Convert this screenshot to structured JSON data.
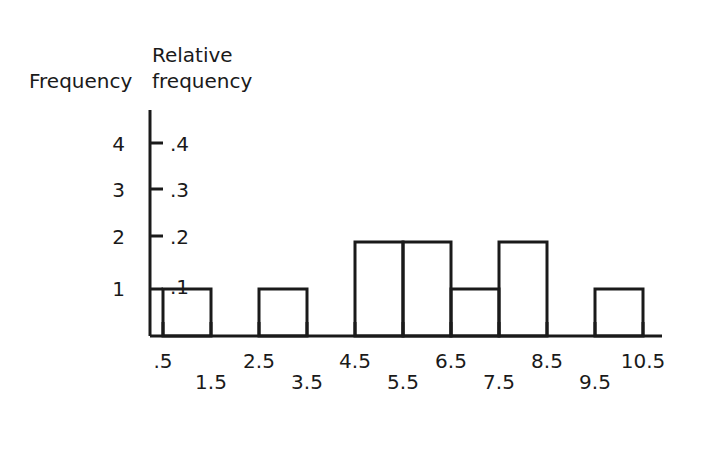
{
  "chart_data": {
    "type": "bar",
    "title": "",
    "subtitle": "",
    "xlabel": "",
    "ylabel": "Frequency",
    "ylabel_secondary": "Relative frequency",
    "grid": false,
    "legend": "none",
    "bin_edges": [
      0.5,
      1.5,
      2.5,
      3.5,
      4.5,
      5.5,
      6.5,
      7.5,
      8.5,
      9.5,
      10.5
    ],
    "categories": [
      "0.5-1.5",
      "1.5-2.5",
      "2.5-3.5",
      "3.5-4.5",
      "4.5-5.5",
      "5.5-6.5",
      "6.5-7.5",
      "7.5-8.5",
      "8.5-9.5",
      "9.5-10.5"
    ],
    "values": [
      1,
      0,
      1,
      0,
      2,
      2,
      1,
      2,
      0,
      1
    ],
    "relative_values": [
      0.1,
      0.0,
      0.1,
      0.0,
      0.2,
      0.2,
      0.1,
      0.2,
      0.0,
      0.1
    ],
    "ylim": [
      0,
      4.4
    ],
    "yticks": [
      1,
      2,
      3,
      4
    ],
    "yticks_secondary": [
      0.1,
      0.2,
      0.3,
      0.4
    ],
    "xticks": [
      0.5,
      1.5,
      2.5,
      3.5,
      4.5,
      5.5,
      6.5,
      7.5,
      8.5,
      9.5,
      10.5
    ]
  },
  "axes": {
    "y_title_left": "Frequency",
    "y_title_right_line1": "Relative",
    "y_title_right_line2": "frequency",
    "y_labels_left": [
      "4",
      "3",
      "2",
      "1"
    ],
    "y_labels_right": [
      ".4",
      ".3",
      ".2",
      ".1"
    ],
    "x_labels": [
      ".5",
      "1.5",
      "2.5",
      "3.5",
      "4.5",
      "5.5",
      "6.5",
      "7.5",
      "8.5",
      "9.5",
      "10.5"
    ]
  },
  "style": {
    "line_color": "#1a1a1a",
    "background": "#ffffff",
    "bar_fill": "none"
  }
}
